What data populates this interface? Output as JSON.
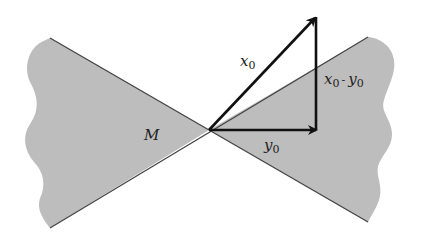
{
  "diagram": {
    "colors": {
      "region": "#bdbdbd",
      "edge": "#444444",
      "vector": "#111111",
      "background": "#ffffff"
    },
    "labels": {
      "region": "M",
      "x0": {
        "base": "x",
        "sub": "0"
      },
      "y0": {
        "base": "y",
        "sub": "0"
      },
      "diff": {
        "a": "x",
        "a_sub": "0",
        "op": "-",
        "b": "y",
        "b_sub": "0"
      }
    }
  }
}
